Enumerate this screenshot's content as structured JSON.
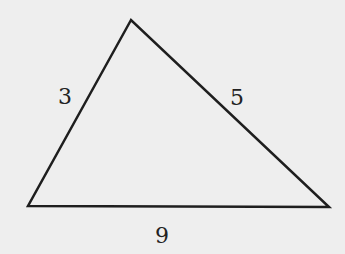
{
  "diagram": {
    "type": "triangle",
    "background": "#eeeeee",
    "stroke": "#1e1e1e",
    "vertices": {
      "top": [
        131,
        20
      ],
      "left": [
        28,
        206
      ],
      "right": [
        329,
        207
      ]
    },
    "sides": [
      {
        "name": "left",
        "label": "3"
      },
      {
        "name": "right",
        "label": "5"
      },
      {
        "name": "bottom",
        "label": "9"
      }
    ]
  }
}
